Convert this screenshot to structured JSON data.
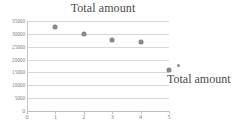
{
  "chart_data": {
    "type": "scatter",
    "title": "Total amount",
    "xlabel": "",
    "ylabel": "",
    "xlim": [
      0,
      5
    ],
    "ylim": [
      0,
      35000
    ],
    "grid": true,
    "legend_position": "right",
    "x": [
      1,
      2,
      3,
      4,
      5
    ],
    "values": [
      32500,
      30000,
      27800,
      27000,
      16000
    ],
    "series": [
      {
        "name": "Total amount",
        "x": [
          1,
          2,
          3,
          4,
          5
        ],
        "values": [
          32500,
          30000,
          27800,
          27000,
          16000
        ]
      }
    ],
    "ytick_labels": [
      "35000",
      "30000",
      "25000",
      "20000",
      "15000",
      "10000",
      "5000",
      "0"
    ],
    "ytick_values": [
      35000,
      30000,
      25000,
      20000,
      15000,
      10000,
      5000,
      0
    ],
    "xtick_labels": [
      "0",
      "1",
      "2",
      "3",
      "4",
      "5"
    ],
    "xtick_values": [
      0,
      1,
      2,
      3,
      4,
      5
    ],
    "legend": [
      "Total amount"
    ],
    "colors": {
      "marker": "#8c8c8c",
      "gridline": "#d7d7d7",
      "axis": "#bdbdbd",
      "text": "#7b7b7b",
      "title": "#4a4a4a",
      "background": "#ffffff"
    }
  }
}
